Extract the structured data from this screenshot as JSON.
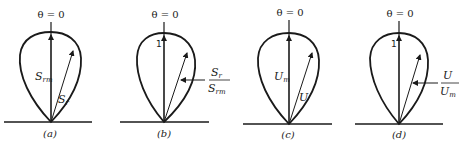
{
  "figure": {
    "panels": [
      {
        "caption": "(a)",
        "top_label": "θ = 0",
        "vertical_label": "S",
        "vertical_sub": "rm",
        "radial_label": "S",
        "radial_sub": "r"
      },
      {
        "caption": "(b)",
        "top_label": "θ = 0",
        "unit_mark": "1",
        "ratio_num": "S",
        "ratio_num_sub": "r",
        "ratio_den": "S",
        "ratio_den_sub": "rm"
      },
      {
        "caption": "(c)",
        "top_label": "θ = 0",
        "vertical_label": "U",
        "vertical_sub": "m",
        "radial_label": "U"
      },
      {
        "caption": "(d)",
        "top_label": "θ = 0",
        "unit_mark": "1",
        "ratio_num": "U",
        "ratio_den": "U",
        "ratio_den_sub": "m"
      }
    ],
    "colors": {
      "ink": "#1a1a1a",
      "background": "#ffffff"
    }
  }
}
